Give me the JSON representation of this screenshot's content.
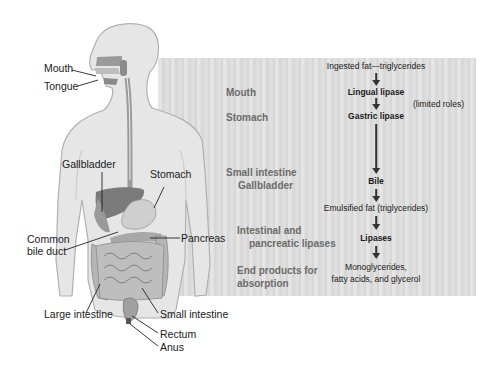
{
  "anatomy_labels": {
    "mouth": "Mouth",
    "tongue": "Tongue",
    "gallbladder": "Gallbladder",
    "stomach": "Stomach",
    "common_bile_duct_line1": "Common",
    "common_bile_duct_line2": "bile duct",
    "pancreas": "Pancreas",
    "large_intestine": "Large intestine",
    "small_intestine": "Small intestine",
    "rectum": "Rectum",
    "anus": "Anus"
  },
  "stages": {
    "mouth": "Mouth",
    "stomach": "Stomach",
    "small_intestine_line1": "Small intestine",
    "small_intestine_line2": "Gallbladder",
    "lipases_line1": "Intestinal and",
    "lipases_line2": "pancreatic lipases",
    "end_line1": "End products for",
    "end_line2": "absorption"
  },
  "flow": {
    "start": "Ingested fat—triglycerides",
    "lingual": "Lingual lipase",
    "gastric": "Gastric lipase",
    "note": "(limited roles)",
    "bile": "Bile",
    "emulsified": "Emulsified fat (triglycerides)",
    "lipases": "Lipases",
    "end_line1": "Monoglycerides,",
    "end_line2": "fatty acids, and glycerol"
  },
  "colors": {
    "panel": "#dcdcdc",
    "stage_text": "#6b6b6b",
    "body_fill": "#e6e6e6",
    "organ_dark": "#7a7a7a"
  }
}
